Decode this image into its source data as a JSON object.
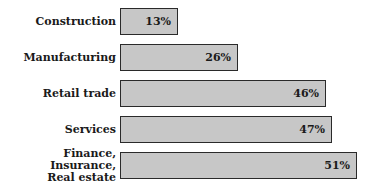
{
  "chart_data": {
    "type": "bar",
    "orientation": "horizontal",
    "title": "",
    "xlabel": "",
    "ylabel": "",
    "categories": [
      "Construction",
      "Manufacturing",
      "Retail trade",
      "Services",
      "Finance, Insurance,\nReal estate"
    ],
    "values": [
      13,
      26,
      46,
      47,
      51
    ],
    "value_labels": [
      "13%",
      "26%",
      "46%",
      "47%",
      "51%"
    ],
    "xlim": [
      0,
      55
    ],
    "grid": false,
    "legend": "none",
    "bar_color": "#c7c7c7",
    "bar_border_color": "#2a2a2a"
  },
  "bars": [
    {
      "label": "Construction",
      "value_label": "13%",
      "width": 56,
      "top": 8
    },
    {
      "label": "Manufacturing",
      "value_label": "26%",
      "width": 116,
      "top": 44
    },
    {
      "label": "Retail trade",
      "value_label": "46%",
      "width": 204,
      "top": 80
    },
    {
      "label": "Services",
      "value_label": "47%",
      "width": 210,
      "top": 116
    },
    {
      "label": "Finance, Insurance,\nReal estate",
      "value_label": "51%",
      "width": 235,
      "top": 152
    }
  ]
}
